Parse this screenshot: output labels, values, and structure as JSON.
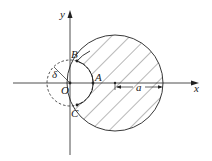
{
  "diagram": {
    "type": "geometry-figure",
    "axes": {
      "x_label": "x",
      "y_label": "y"
    },
    "points": {
      "origin": "O",
      "A": "A",
      "B": "B",
      "C": "C"
    },
    "labels": {
      "delta": "δ",
      "radius_a": "a"
    },
    "colors": {
      "stroke": "#222222",
      "background": "#ffffff"
    }
  }
}
